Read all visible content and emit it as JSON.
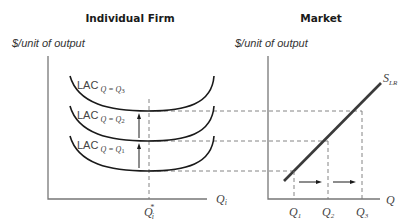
{
  "panels": {
    "firm": {
      "title": "Individual Firm",
      "y_label": "$/unit of output",
      "x_label": "Q",
      "x_label_sub": "i",
      "q_star": "Q",
      "q_star_sub": "i",
      "q_star_sup": "*",
      "curves": [
        {
          "label": "LAC",
          "sub": "Q = Q",
          "sub_idx": "3"
        },
        {
          "label": "LAC",
          "sub": "Q = Q",
          "sub_idx": "2"
        },
        {
          "label": "LAC",
          "sub": "Q = Q",
          "sub_idx": "1"
        }
      ]
    },
    "market": {
      "title": "Market",
      "y_label": "$/unit of output",
      "x_label": "Q",
      "supply_label": "S",
      "supply_sub": "LR",
      "ticks": [
        {
          "label": "Q",
          "sub": "1"
        },
        {
          "label": "Q",
          "sub": "2"
        },
        {
          "label": "Q",
          "sub": "3"
        }
      ]
    }
  },
  "colors": {
    "curve": "#1a1a1a",
    "axis": "#777777",
    "supply": "#3a3a3a"
  }
}
